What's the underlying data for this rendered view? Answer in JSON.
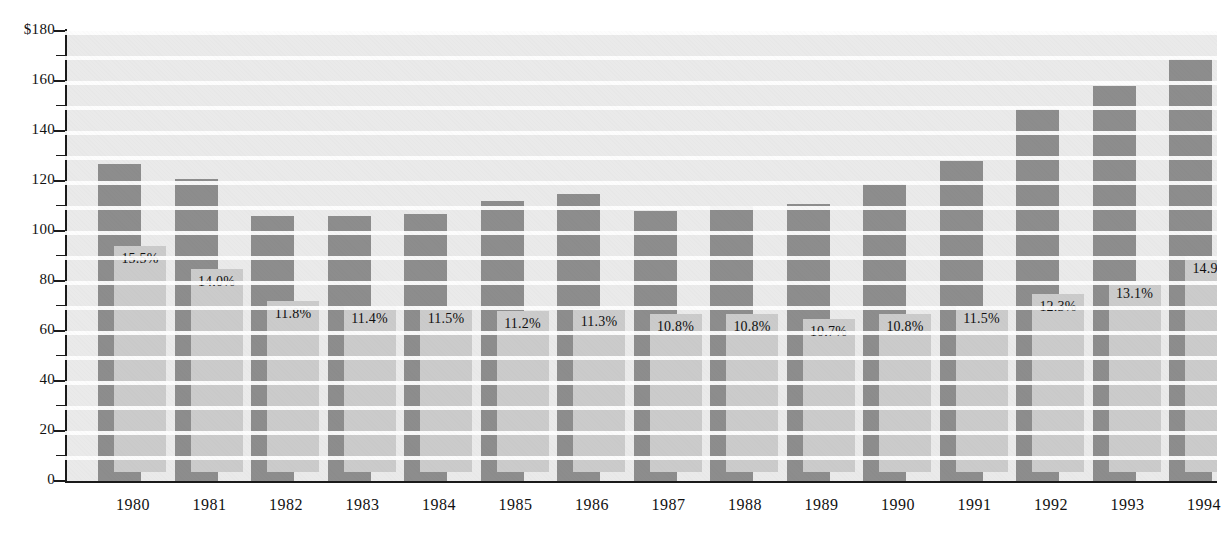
{
  "chart_data": {
    "type": "bar",
    "title": "",
    "xlabel": "",
    "ylabel": "$",
    "ylim": [
      0,
      180
    ],
    "ytick_labels": [
      "$180",
      "160",
      "140",
      "120",
      "100",
      "80",
      "60",
      "40",
      "20",
      "0"
    ],
    "ytick_values": [
      180,
      160,
      140,
      120,
      100,
      80,
      60,
      40,
      20,
      0
    ],
    "yminor_step": 10,
    "grid": true,
    "legend": "none",
    "categories": [
      "1980",
      "1981",
      "1982",
      "1983",
      "1984",
      "1985",
      "1986",
      "1987",
      "1988",
      "1989",
      "1990",
      "1991",
      "1992",
      "1993",
      "1994"
    ],
    "series": [
      {
        "name": "Total",
        "color": "#8d8d8d",
        "values": [
          127,
          121,
          106,
          106,
          107,
          112,
          115,
          108,
          110,
          111,
          119,
          128,
          149,
          158,
          169
        ]
      },
      {
        "name": "Subtotal",
        "color": "#cbcbcb",
        "values": [
          94,
          85,
          72,
          70,
          70,
          68,
          69,
          67,
          67,
          65,
          67,
          70,
          75,
          80,
          90
        ],
        "data_labels": [
          "15.5%",
          "14.0%",
          "11.8%",
          "11.4%",
          "11.5%",
          "11.2%",
          "11.3%",
          "10.8%",
          "10.8%",
          "10.7%",
          "10.8%",
          "11.5%",
          "12.3%",
          "13.1%",
          "14.9%"
        ]
      }
    ],
    "colors": {
      "back_bar": "#8d8d8d",
      "front_bar": "#cbcbcb",
      "plot_background": "#eaeaea",
      "gridline": "#ffffff",
      "axis": "#1a1a1a",
      "text": "#111111"
    }
  }
}
